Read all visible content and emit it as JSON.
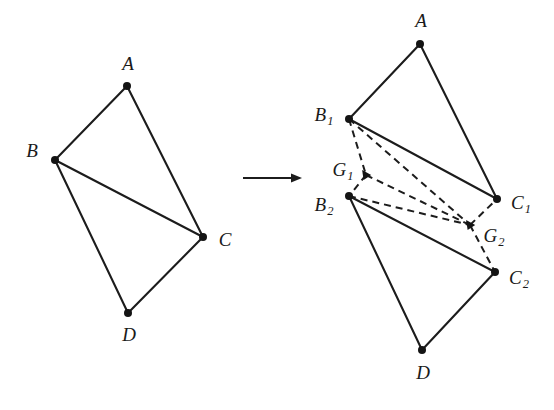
{
  "figure": {
    "background_color": "#ffffff",
    "ink_color": "#1c1c1c",
    "width": 554,
    "height": 410
  },
  "transition_arrow": {
    "name": "transforms-into",
    "symbol": "→",
    "x1": 243,
    "y1": 178,
    "x2": 302,
    "y2": 178
  },
  "left_figure": {
    "name": "original-quadrilateral",
    "vertices": [
      {
        "id": "A",
        "label": "A",
        "sub": "",
        "x": 127,
        "y": 86,
        "label_x": 128,
        "label_y": 66,
        "label_anchor": "middle"
      },
      {
        "id": "B",
        "label": "B",
        "sub": "",
        "x": 55,
        "y": 160,
        "label_x": 32,
        "label_y": 153,
        "label_anchor": "middle"
      },
      {
        "id": "C",
        "label": "C",
        "sub": "",
        "x": 203,
        "y": 237,
        "label_x": 225,
        "label_y": 242,
        "label_anchor": "middle"
      },
      {
        "id": "D",
        "label": "D",
        "sub": "",
        "x": 128,
        "y": 313,
        "label_x": 129,
        "label_y": 337,
        "label_anchor": "middle"
      }
    ],
    "solid_edges": [
      {
        "from": "A",
        "to": "B"
      },
      {
        "from": "A",
        "to": "C"
      },
      {
        "from": "B",
        "to": "C"
      },
      {
        "from": "B",
        "to": "D"
      },
      {
        "from": "D",
        "to": "C"
      }
    ],
    "dashed_edges": []
  },
  "right_figure": {
    "name": "split-quadrilateral-with-centroids",
    "vertices": [
      {
        "id": "A",
        "label": "A",
        "sub": "",
        "x": 420,
        "y": 44,
        "label_x": 421,
        "label_y": 23,
        "label_anchor": "middle"
      },
      {
        "id": "B1",
        "label": "B",
        "sub": "1",
        "x": 349,
        "y": 119,
        "label_x": 324,
        "label_y": 117,
        "label_anchor": "middle"
      },
      {
        "id": "C1",
        "label": "C",
        "sub": "1",
        "x": 497,
        "y": 199,
        "label_x": 521,
        "label_y": 205,
        "label_anchor": "middle"
      },
      {
        "id": "B2",
        "label": "B",
        "sub": "2",
        "x": 349,
        "y": 196,
        "label_x": 324,
        "label_y": 207,
        "label_anchor": "middle"
      },
      {
        "id": "C2",
        "label": "C",
        "sub": "2",
        "x": 495,
        "y": 272,
        "label_x": 519,
        "label_y": 280,
        "label_anchor": "middle"
      },
      {
        "id": "D",
        "label": "D",
        "sub": "",
        "x": 422,
        "y": 350,
        "label_x": 423,
        "label_y": 375,
        "label_anchor": "middle"
      }
    ],
    "centroids": [
      {
        "id": "G1",
        "label": "G",
        "sub": "1",
        "x": 366,
        "y": 175,
        "label_x": 343,
        "label_y": 172,
        "label_anchor": "middle"
      },
      {
        "id": "G2",
        "label": "G",
        "sub": "2",
        "x": 470,
        "y": 225,
        "label_x": 494,
        "label_y": 238,
        "label_anchor": "middle"
      }
    ],
    "solid_edges": [
      {
        "from": "A",
        "to": "B1"
      },
      {
        "from": "A",
        "to": "C1"
      },
      {
        "from": "B1",
        "to": "C1"
      },
      {
        "from": "B2",
        "to": "C2"
      },
      {
        "from": "B2",
        "to": "D"
      },
      {
        "from": "D",
        "to": "C2"
      }
    ],
    "dashed_edges": [
      {
        "from": "B1",
        "to": "G1"
      },
      {
        "from": "G1",
        "to": "B2"
      },
      {
        "from": "B1",
        "to": "G2"
      },
      {
        "from": "G1",
        "to": "G2"
      },
      {
        "from": "B2",
        "to": "G2"
      },
      {
        "from": "G2",
        "to": "C1"
      },
      {
        "from": "G2",
        "to": "C2"
      }
    ]
  }
}
